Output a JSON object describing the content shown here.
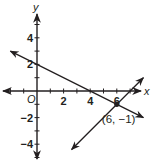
{
  "graph": {
    "x_axis_label": "x",
    "y_axis_label": "y",
    "origin_label": "O",
    "x_range": [
      -2.5,
      8
    ],
    "y_range": [
      -5,
      5.5
    ],
    "x_tick_step": 1,
    "y_tick_step": 1,
    "x_tick_labels": [
      {
        "value": 2,
        "label": "2"
      },
      {
        "value": 4,
        "label": "4"
      },
      {
        "value": 6,
        "label": "6"
      }
    ],
    "y_tick_labels": [
      {
        "value": 4,
        "label": "4"
      },
      {
        "value": 2,
        "label": "2"
      },
      {
        "value": -2,
        "label": "−2"
      },
      {
        "value": -4,
        "label": "−4"
      }
    ],
    "lines": [
      {
        "name": "line-1",
        "equation": "y = -x/2 + 2",
        "from": [
          -2,
          3
        ],
        "to": [
          8,
          -2
        ]
      },
      {
        "name": "line-2",
        "equation": "y = x - 7",
        "from": [
          2.6,
          -4.4
        ],
        "to": [
          8,
          1
        ]
      }
    ],
    "intersection": {
      "point": [
        6,
        -1
      ],
      "label": "(6, −1)"
    }
  }
}
